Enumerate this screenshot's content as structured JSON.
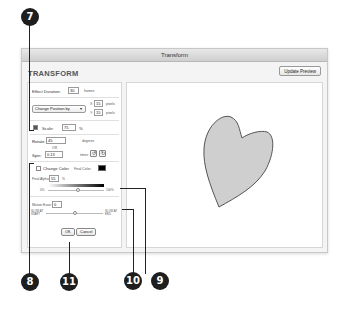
{
  "dialog": {
    "window_title": "Transform",
    "heading": "TRANSFORM",
    "update_preview_label": "Update Preview"
  },
  "effect": {
    "duration_label": "Effect Duration:",
    "duration_value": "30",
    "duration_unit": "frames"
  },
  "position": {
    "mode_selected": "Change Position by",
    "x_label": "X:",
    "x_value": "15",
    "y_label": "Y:",
    "y_value": "15",
    "unit": "pixels"
  },
  "scale": {
    "label": "Scale:",
    "value": "75",
    "unit": "%"
  },
  "rotate": {
    "label": "Rotate:",
    "value": "45",
    "unit": "degrees",
    "or_label": "OR",
    "spin_label": "Spin:",
    "spin_value": "0.13",
    "spin_unit": "times",
    "ccw_icon": "rotate-ccw-icon",
    "cw_icon": "rotate-cw-icon"
  },
  "color": {
    "change_color_label": "Change Color",
    "final_color_label": "Final Color:",
    "final_color_value": "#000000",
    "final_alpha_label": "Final Alpha:",
    "final_alpha_value": "55",
    "final_alpha_unit": "%",
    "alpha_min_label": "0%",
    "alpha_max_label": "100%"
  },
  "motion": {
    "ease_label": "Motion Ease:",
    "ease_value": "0",
    "slow_start_label": "SLOW AT START",
    "slow_end_label": "SLOW AT END"
  },
  "buttons": {
    "ok_label": "OK",
    "cancel_label": "Cancel"
  },
  "preview": {
    "shape": "heart",
    "fill_color": "#cfcfcf",
    "stroke_color": "#555555"
  },
  "callouts": [
    "7",
    "8",
    "9",
    "10",
    "11"
  ]
}
